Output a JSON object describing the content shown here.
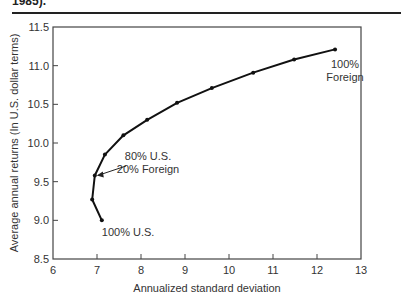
{
  "caption_fragment": "1985).",
  "chart_data": {
    "type": "line",
    "title": "",
    "xlabel": "Annualized standard deviation",
    "ylabel": "Average annual returns (In U.S. dollar terms)",
    "xlim": [
      6,
      13
    ],
    "ylim": [
      8.5,
      11.5
    ],
    "xticks": [
      "6",
      "7",
      "8",
      "9",
      "10",
      "11",
      "12",
      "13"
    ],
    "yticks": [
      "8.5",
      "9.0",
      "9.5",
      "10.0",
      "10.5",
      "11.0",
      "11.5"
    ],
    "grid": false,
    "legend": null,
    "series": [
      {
        "name": "U.S./Foreign portfolio frontier",
        "x": [
          7.11,
          6.89,
          6.95,
          7.18,
          7.6,
          8.14,
          8.82,
          9.61,
          10.55,
          11.48,
          12.41
        ],
        "y": [
          9.0,
          9.27,
          9.58,
          9.85,
          10.1,
          10.3,
          10.52,
          10.71,
          10.91,
          11.08,
          11.21
        ]
      }
    ],
    "annotations": [
      {
        "text": [
          "100% U.S."
        ],
        "point_index": 0
      },
      {
        "text": [
          "80% U.S.",
          "20% Foreign"
        ],
        "point_index": 2,
        "arrow": true
      },
      {
        "text": [
          "100%",
          "Foreign"
        ],
        "point_index": 10
      }
    ]
  }
}
